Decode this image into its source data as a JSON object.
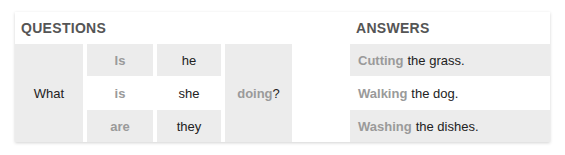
{
  "headers": {
    "questions": "QUESTIONS",
    "answers": "ANSWERS"
  },
  "question": {
    "word": "What",
    "auxiliaries": [
      "Is",
      "is",
      "are"
    ],
    "subjects": [
      "he",
      "she",
      "they"
    ],
    "verb_highlight": "doing",
    "verb_suffix": "?"
  },
  "answers": [
    {
      "verb": "Cutting",
      "rest": "the grass."
    },
    {
      "verb": "Walking",
      "rest": "the dog."
    },
    {
      "verb": "Washing",
      "rest": "the dishes."
    }
  ],
  "colors": {
    "cell_gray": "#ececec",
    "muted_text": "#9a9a9a",
    "header_text": "#555555"
  }
}
